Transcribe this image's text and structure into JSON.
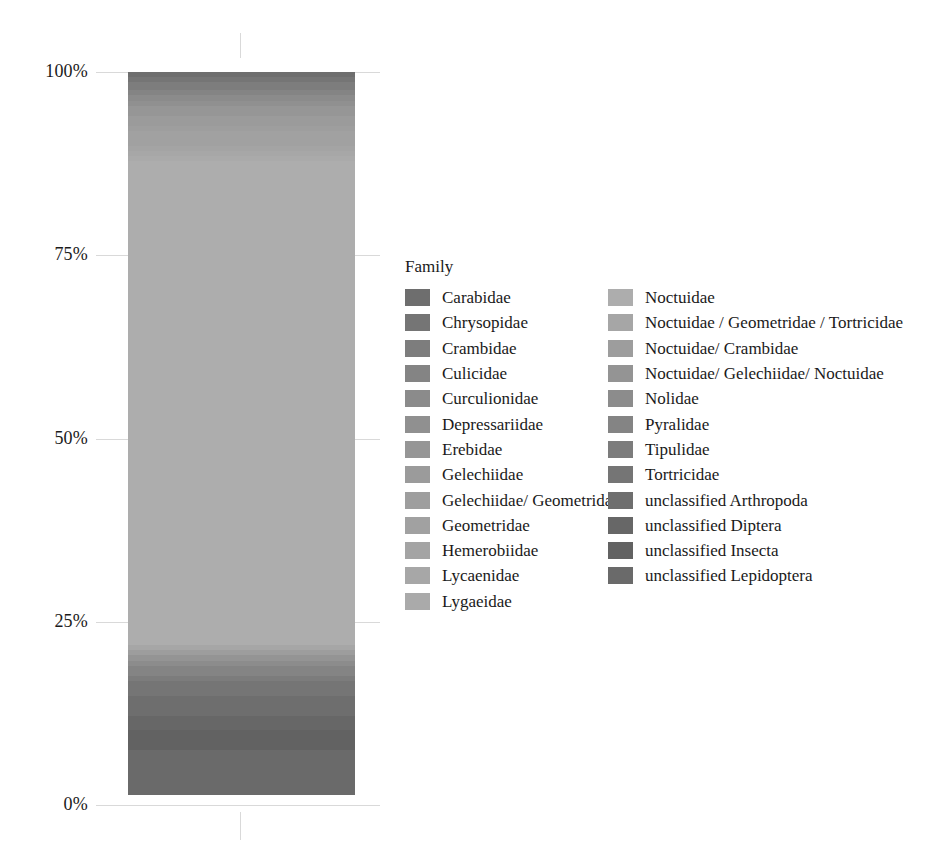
{
  "chart_data": {
    "type": "bar",
    "subtype": "stacked-percentage-single-bar",
    "title": "",
    "xlabel": "",
    "ylabel": "",
    "ylim": [
      0,
      100
    ],
    "grid": true,
    "legend_position": "right",
    "legend_title": "Family",
    "y_ticks": [
      "0%",
      "25%",
      "50%",
      "75%",
      "100%"
    ],
    "y_tick_values": [
      0,
      25,
      50,
      75,
      100
    ],
    "categories": [
      "Sample"
    ],
    "series": [
      {
        "name": "Carabidae",
        "values": [
          0.7
        ],
        "color": "#6e6e6e"
      },
      {
        "name": "Chrysopidae",
        "values": [
          0.7
        ],
        "color": "#757575"
      },
      {
        "name": "Crambidae",
        "values": [
          1.1
        ],
        "color": "#7d7d7d"
      },
      {
        "name": "Culicidae",
        "values": [
          0.7
        ],
        "color": "#848484"
      },
      {
        "name": "Curculionidae",
        "values": [
          0.7
        ],
        "color": "#8b8b8b"
      },
      {
        "name": "Depressariidae",
        "values": [
          0.7
        ],
        "color": "#909090"
      },
      {
        "name": "Erebidae",
        "values": [
          1.4
        ],
        "color": "#969696"
      },
      {
        "name": "Gelechiidae",
        "values": [
          1.4
        ],
        "color": "#9b9b9b"
      },
      {
        "name": "Gelechiidae/ Geometridae",
        "values": [
          0.7
        ],
        "color": "#9e9e9e"
      },
      {
        "name": "Geometridae",
        "values": [
          2.0
        ],
        "color": "#a1a1a1"
      },
      {
        "name": "Hemerobiidae",
        "values": [
          0.7
        ],
        "color": "#a4a4a4"
      },
      {
        "name": "Lycaenidae",
        "values": [
          0.7
        ],
        "color": "#a7a7a7"
      },
      {
        "name": "Lygaeidae",
        "values": [
          0.7
        ],
        "color": "#aaaaaa"
      },
      {
        "name": "Noctuidae",
        "values": [
          66.0
        ],
        "color": "#adadad"
      },
      {
        "name": "Noctuidae / Geometridae / Tortricidae",
        "values": [
          0.7
        ],
        "color": "#a6a6a6"
      },
      {
        "name": "Noctuidae/ Crambidae",
        "values": [
          0.7
        ],
        "color": "#9d9d9d"
      },
      {
        "name": "Noctuidae/ Gelechiidae/ Noctuidae",
        "values": [
          0.7
        ],
        "color": "#949494"
      },
      {
        "name": "Nolidae",
        "values": [
          0.7
        ],
        "color": "#8c8c8c"
      },
      {
        "name": "Pyralidae",
        "values": [
          1.4
        ],
        "color": "#848484"
      },
      {
        "name": "Tipulidae",
        "values": [
          0.7
        ],
        "color": "#7c7c7c"
      },
      {
        "name": "Tortricidae",
        "values": [
          2.0
        ],
        "color": "#757575"
      },
      {
        "name": "unclassified Arthropoda",
        "values": [
          2.7
        ],
        "color": "#6e6e6e"
      },
      {
        "name": "unclassified Diptera",
        "values": [
          2.0
        ],
        "color": "#676767"
      },
      {
        "name": "unclassified Insecta",
        "values": [
          2.7
        ],
        "color": "#626262"
      },
      {
        "name": "unclassified Lepidoptera",
        "values": [
          6.1
        ],
        "color": "#6a6a6a"
      }
    ]
  },
  "axis": {
    "ticks": [
      {
        "label": "100%",
        "value": 100
      },
      {
        "label": "75%",
        "value": 75
      },
      {
        "label": "50%",
        "value": 50
      },
      {
        "label": "25%",
        "value": 25
      },
      {
        "label": "0%",
        "value": 0
      }
    ]
  },
  "legend": {
    "title": "Family",
    "column1": [
      {
        "label": "Carabidae",
        "color": "#6e6e6e"
      },
      {
        "label": "Chrysopidae",
        "color": "#757575"
      },
      {
        "label": "Crambidae",
        "color": "#7d7d7d"
      },
      {
        "label": "Culicidae",
        "color": "#848484"
      },
      {
        "label": "Curculionidae",
        "color": "#8b8b8b"
      },
      {
        "label": "Depressariidae",
        "color": "#909090"
      },
      {
        "label": "Erebidae",
        "color": "#969696"
      },
      {
        "label": "Gelechiidae",
        "color": "#9b9b9b"
      },
      {
        "label": "Gelechiidae/ Geometridae",
        "color": "#9e9e9e"
      },
      {
        "label": "Geometridae",
        "color": "#a1a1a1"
      },
      {
        "label": "Hemerobiidae",
        "color": "#a4a4a4"
      },
      {
        "label": "Lycaenidae",
        "color": "#a7a7a7"
      },
      {
        "label": "Lygaeidae",
        "color": "#aaaaaa"
      }
    ],
    "column2": [
      {
        "label": "Noctuidae",
        "color": "#adadad"
      },
      {
        "label": "Noctuidae / Geometridae / Tortricidae",
        "color": "#a6a6a6"
      },
      {
        "label": "Noctuidae/ Crambidae",
        "color": "#9d9d9d"
      },
      {
        "label": "Noctuidae/ Gelechiidae/ Noctuidae",
        "color": "#949494"
      },
      {
        "label": "Nolidae",
        "color": "#8c8c8c"
      },
      {
        "label": "Pyralidae",
        "color": "#848484"
      },
      {
        "label": "Tipulidae",
        "color": "#7c7c7c"
      },
      {
        "label": "Tortricidae",
        "color": "#757575"
      },
      {
        "label": "unclassified Arthropoda",
        "color": "#6e6e6e"
      },
      {
        "label": "unclassified Diptera",
        "color": "#676767"
      },
      {
        "label": "unclassified Insecta",
        "color": "#626262"
      },
      {
        "label": "unclassified Lepidoptera",
        "color": "#6a6a6a"
      }
    ]
  },
  "colors": {
    "gridline": "#d9d9d9",
    "text": "#1a1a1a",
    "background": "#ffffff"
  }
}
